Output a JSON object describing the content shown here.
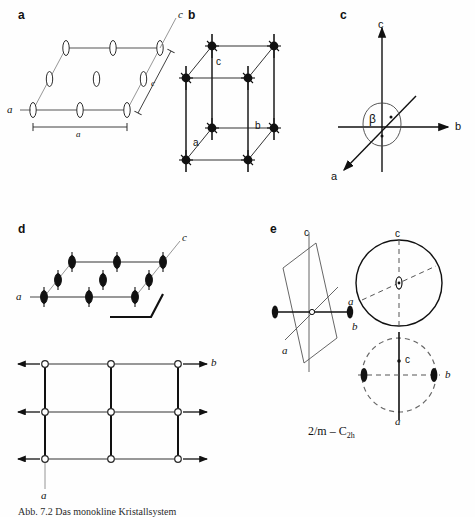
{
  "figure": {
    "title_caption": "Abb. 7.2  Das monokline Kristallsystem",
    "point_group_main": "2/m",
    "point_group_dash": "–",
    "point_group_schoenflies": "C",
    "point_group_schoenflies_sub": "2h",
    "ink_color": "#1a1a1a",
    "line_color": "#4a4a4a",
    "background": "#fefefe"
  },
  "panels": [
    {
      "id": "a",
      "letter": "a",
      "description": "monoclinic unit cell in projection with open twofold axis symbols",
      "labels": [
        {
          "key": "axis_c_top",
          "text": "c"
        },
        {
          "key": "axis_c_edge",
          "text": "c"
        },
        {
          "key": "axis_a_left",
          "text": "a"
        },
        {
          "key": "dim_a",
          "text": "a"
        }
      ]
    },
    {
      "id": "b",
      "letter": "b",
      "description": "monoclinic lattice points with twofold rotation axes",
      "labels": [
        {
          "key": "axis_c",
          "text": "c"
        },
        {
          "key": "axis_b",
          "text": "b"
        },
        {
          "key": "axis_a",
          "text": "a"
        }
      ]
    },
    {
      "id": "c",
      "letter": "c",
      "description": "crystallographic axes a, b, c with beta angle",
      "labels": [
        {
          "key": "axis_c",
          "text": "c"
        },
        {
          "key": "axis_b",
          "text": "b"
        },
        {
          "key": "axis_a",
          "text": "a"
        },
        {
          "key": "angle_beta",
          "text": "β"
        }
      ]
    },
    {
      "id": "d",
      "letter": "d",
      "description": "unit cell with filled twofold screw axis symbols and mirror plane trace; below a plan view with open circles and arrows",
      "labels": [
        {
          "key": "axis_c",
          "text": "c"
        },
        {
          "key": "axis_a_top",
          "text": "a"
        },
        {
          "key": "axis_b_plan",
          "text": "b"
        },
        {
          "key": "axis_a_plan",
          "text": "a"
        }
      ]
    },
    {
      "id": "e",
      "letter": "e",
      "description": "mirror plane perpendicular to the twofold axis b with two stereographic projections",
      "labels": [
        {
          "key": "axis_c",
          "text": "c"
        },
        {
          "key": "axis_b",
          "text": "b"
        },
        {
          "key": "axis_a",
          "text": "a"
        },
        {
          "key": "stereo_top_c",
          "text": "c"
        },
        {
          "key": "stereo_top_a",
          "text": "a"
        },
        {
          "key": "stereo_bottom_c",
          "text": "c"
        },
        {
          "key": "stereo_bottom_b",
          "text": "b"
        },
        {
          "key": "stereo_bottom_a",
          "text": "a"
        }
      ]
    }
  ]
}
